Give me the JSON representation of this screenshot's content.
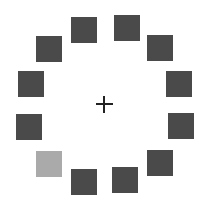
{
  "colors": {
    "background": "#ffffff",
    "dark_square": "#4a4a4a",
    "light_square": "#aaaaaa",
    "fixation": "#222222"
  },
  "fixation_cross": {
    "symbol": "+",
    "cx": 104,
    "cy": 104
  },
  "squares": [
    {
      "id": "top-left-mid",
      "x": 71,
      "y": 17,
      "shade": "dark"
    },
    {
      "id": "top-right-mid",
      "x": 114,
      "y": 15,
      "shade": "dark"
    },
    {
      "id": "upper-left",
      "x": 36,
      "y": 36,
      "shade": "dark"
    },
    {
      "id": "upper-right",
      "x": 147,
      "y": 35,
      "shade": "dark"
    },
    {
      "id": "left-upper",
      "x": 18,
      "y": 71,
      "shade": "dark"
    },
    {
      "id": "right-upper",
      "x": 166,
      "y": 71,
      "shade": "dark"
    },
    {
      "id": "left-lower",
      "x": 16,
      "y": 114,
      "shade": "dark"
    },
    {
      "id": "right-lower",
      "x": 168,
      "y": 113,
      "shade": "dark"
    },
    {
      "id": "lower-left",
      "x": 36,
      "y": 151,
      "shade": "light"
    },
    {
      "id": "lower-right",
      "x": 147,
      "y": 150,
      "shade": "dark"
    },
    {
      "id": "bottom-left-mid",
      "x": 71,
      "y": 169,
      "shade": "dark"
    },
    {
      "id": "bottom-right-mid",
      "x": 112,
      "y": 167,
      "shade": "dark"
    }
  ]
}
